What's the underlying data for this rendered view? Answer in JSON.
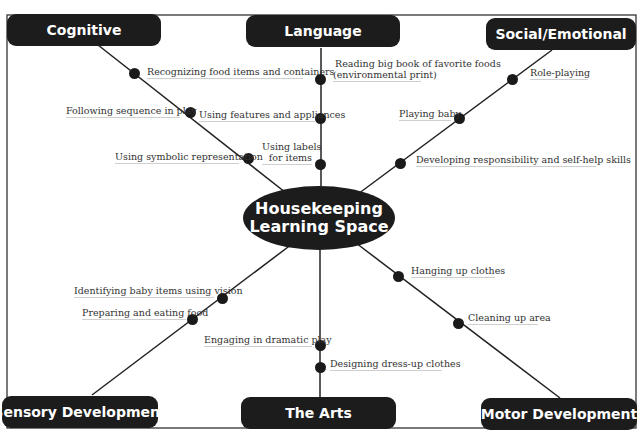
{
  "diagram": {
    "center": {
      "line1": "Housekeeping",
      "line2": "Learning Space"
    },
    "domains": {
      "cognitive": "Cognitive",
      "language": "Language",
      "social_emotional": "Social/Emotional",
      "sensory": "Sensory Development",
      "arts": "The Arts",
      "motor": "Motor Development"
    },
    "branches": {
      "cognitive": [
        "Recognizing food items and containers",
        "Following sequence in play",
        "Using symbolic representation"
      ],
      "language": [
        "Reading big book of favorite foods",
        "(environmental print)",
        "Using features and appliances",
        "Using labels",
        "for items"
      ],
      "social_emotional": [
        "Role-playing",
        "Playing baby",
        "Developing responsibility and self-help skills"
      ],
      "sensory": [
        "Identifying baby items using vision",
        "Preparing and eating food"
      ],
      "arts": [
        "Engaging in dramatic play",
        "Designing dress-up clothes"
      ],
      "motor": [
        "Hanging  up clothes",
        "Cleaning up area"
      ]
    },
    "colors": {
      "box": "#1c1c1c",
      "line": "#222222",
      "text": "#333333"
    }
  }
}
